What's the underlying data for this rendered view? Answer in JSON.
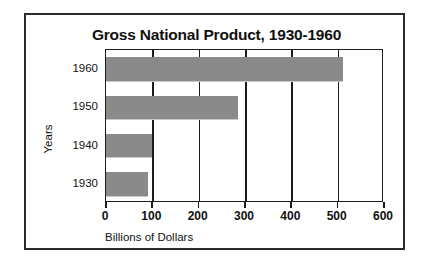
{
  "chart_data": {
    "type": "bar",
    "orientation": "horizontal",
    "title": "Gross National Product, 1930-1960",
    "xlabel": "Billions of Dollars",
    "ylabel": "Years",
    "categories": [
      "1960",
      "1950",
      "1940",
      "1930"
    ],
    "values": [
      512,
      285,
      100,
      91
    ],
    "xlim": [
      0,
      600
    ],
    "xticks": [
      0,
      100,
      200,
      300,
      400,
      500,
      600
    ],
    "xtick_labels": [
      "0",
      "100",
      "200",
      "300",
      "400",
      "500",
      "600"
    ],
    "grid": "vertical",
    "legend": "none",
    "bar_color": "#8a8a8a",
    "axis_color": "#1c1c1c",
    "series": [
      {
        "name": "Gross National Product",
        "values": [
          512,
          285,
          100,
          91
        ]
      }
    ]
  }
}
